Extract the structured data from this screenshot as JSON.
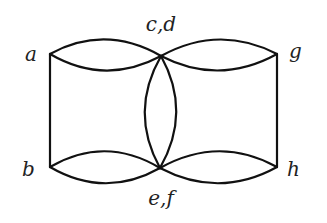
{
  "diagram": {
    "type": "multigraph",
    "colors": {
      "edge": "#111111",
      "label": "#222222",
      "background": "#ffffff"
    },
    "vertices": [
      {
        "id": "a",
        "label": "a",
        "x": 50,
        "y": 54
      },
      {
        "id": "b",
        "label": "b",
        "x": 50,
        "y": 167
      },
      {
        "id": "cd",
        "label": "c,d",
        "x": 161,
        "y": 56
      },
      {
        "id": "ef",
        "label": "e,f",
        "x": 160,
        "y": 168
      },
      {
        "id": "g",
        "label": "g",
        "x": 277,
        "y": 54
      },
      {
        "id": "h",
        "label": "h",
        "x": 277,
        "y": 167
      }
    ],
    "edges": [
      {
        "from": "a",
        "to": "b",
        "shape": "straight"
      },
      {
        "from": "g",
        "to": "h",
        "shape": "straight"
      },
      {
        "from": "a",
        "to": "cd",
        "shape": "arc-up"
      },
      {
        "from": "a",
        "to": "cd",
        "shape": "arc-down"
      },
      {
        "from": "cd",
        "to": "g",
        "shape": "arc-up"
      },
      {
        "from": "cd",
        "to": "g",
        "shape": "arc-down"
      },
      {
        "from": "b",
        "to": "ef",
        "shape": "arc-up"
      },
      {
        "from": "b",
        "to": "ef",
        "shape": "arc-down"
      },
      {
        "from": "ef",
        "to": "h",
        "shape": "arc-up"
      },
      {
        "from": "ef",
        "to": "h",
        "shape": "arc-down"
      },
      {
        "from": "cd",
        "to": "ef",
        "shape": "arc-left"
      },
      {
        "from": "cd",
        "to": "ef",
        "shape": "arc-right"
      }
    ],
    "labels": {
      "a": "a",
      "b": "b",
      "cd": "c,d",
      "ef": "e,f",
      "g": "g",
      "h": "h"
    }
  }
}
